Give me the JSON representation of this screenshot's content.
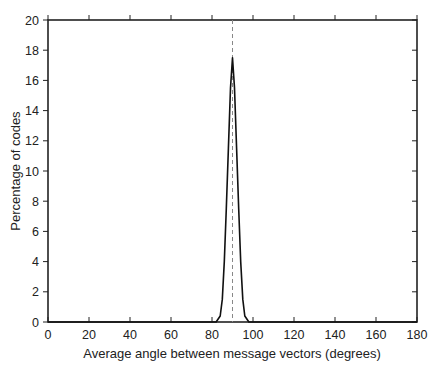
{
  "chart_data": {
    "type": "line",
    "title": "",
    "xlabel": "Average angle between message vectors (degrees)",
    "ylabel": "Percentage of codes",
    "xlim": [
      0,
      180
    ],
    "ylim": [
      0,
      20
    ],
    "xticks": [
      0,
      20,
      40,
      60,
      80,
      100,
      120,
      140,
      160,
      180
    ],
    "yticks": [
      0,
      2,
      4,
      6,
      8,
      10,
      12,
      14,
      16,
      18,
      20
    ],
    "grid": false,
    "legend": null,
    "reference_line": {
      "x": 90,
      "style": "dashed",
      "color": "#888888"
    },
    "series": [
      {
        "name": "distribution",
        "color": "#111111",
        "x": [
          0,
          82,
          84,
          85,
          86,
          87,
          88,
          89,
          90,
          91,
          92,
          93,
          94,
          95,
          96,
          98,
          180
        ],
        "y": [
          0,
          0,
          0.4,
          1.5,
          4.0,
          7.5,
          11.5,
          15.5,
          17.5,
          15.5,
          11.5,
          7.5,
          4.0,
          1.5,
          0.4,
          0,
          0
        ]
      }
    ]
  }
}
